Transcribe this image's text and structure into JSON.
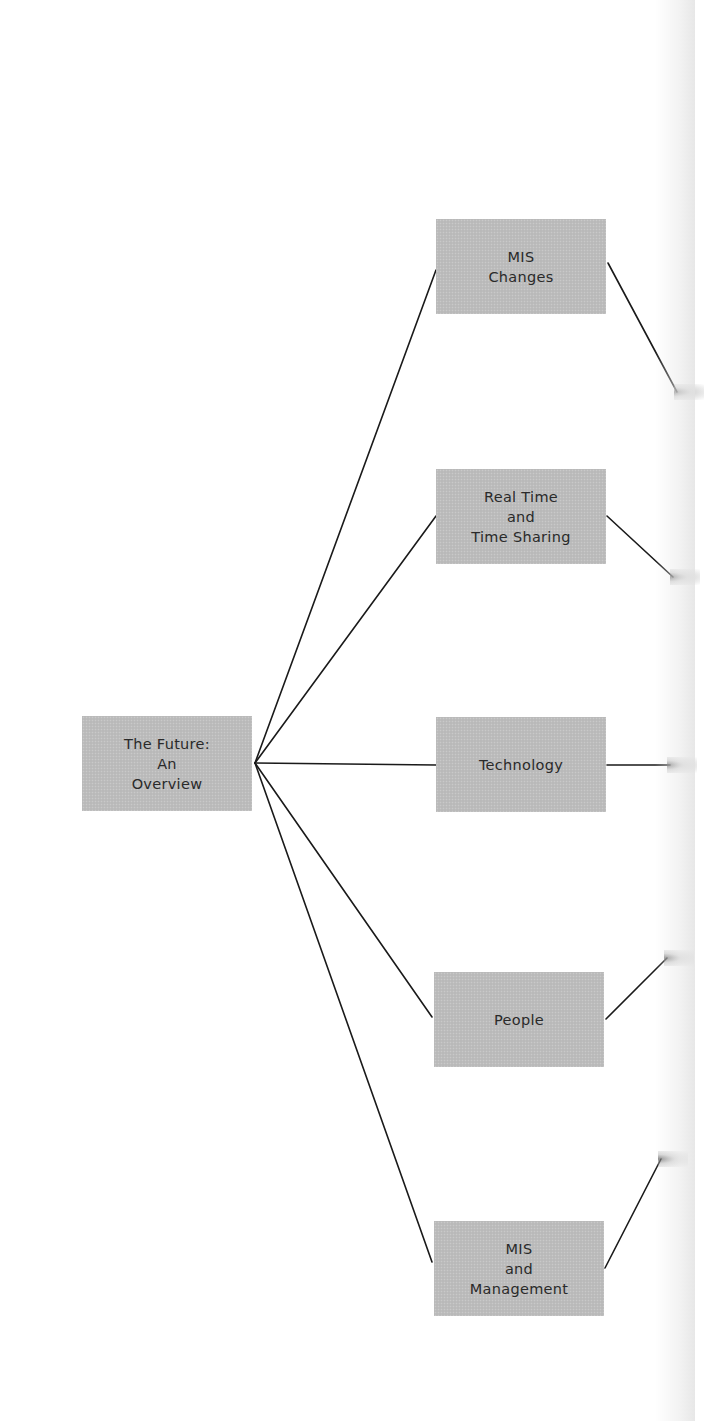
{
  "diagram": {
    "type": "tree",
    "root": {
      "lines": [
        "The Future:",
        "An",
        "Overview"
      ]
    },
    "children": [
      {
        "id": "mis-changes",
        "lines": [
          "MIS",
          "Changes"
        ]
      },
      {
        "id": "real-time",
        "lines": [
          "Real Time",
          "and",
          "Time Sharing"
        ]
      },
      {
        "id": "technology",
        "lines": [
          "Technology"
        ]
      },
      {
        "id": "people",
        "lines": [
          "People"
        ]
      },
      {
        "id": "mis-management",
        "lines": [
          "MIS",
          "and",
          "Management"
        ]
      }
    ],
    "colors": {
      "box_fill": "#bdbdbd",
      "text": "#2a2a2a",
      "line": "#1a1a1a",
      "background": "#ffffff"
    }
  }
}
